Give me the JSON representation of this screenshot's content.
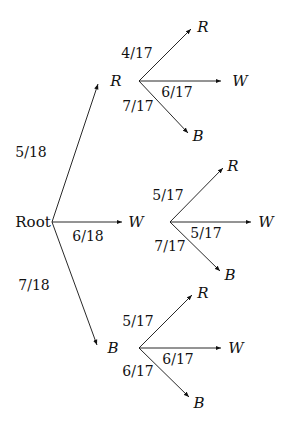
{
  "diagram": {
    "type": "probability-tree",
    "root": {
      "label": "Root",
      "x": 33,
      "y": 222
    },
    "first_level": [
      {
        "label": "R",
        "prob": "5/18",
        "node_x": 116,
        "node_y": 81,
        "tip_x": 98,
        "tip_y": 84,
        "prob_x": 31,
        "prob_y": 152
      },
      {
        "label": "W",
        "prob": "6/18",
        "node_x": 136,
        "node_y": 222,
        "tip_x": 122,
        "tip_y": 222,
        "prob_x": 88,
        "prob_y": 236
      },
      {
        "label": "B",
        "prob": "7/18",
        "node_x": 113,
        "node_y": 348,
        "tip_x": 97,
        "tip_y": 345,
        "prob_x": 34,
        "prob_y": 285
      }
    ],
    "second_level": [
      {
        "parent": "R",
        "origin_x": 139,
        "origin_y": 81,
        "branches": [
          {
            "label": "R",
            "prob": "4/17",
            "tip_x": 191,
            "tip_y": 29,
            "node_x": 203,
            "node_y": 27,
            "prob_x": 137,
            "prob_y": 53
          },
          {
            "label": "W",
            "prob": "6/17",
            "tip_x": 221,
            "tip_y": 81,
            "node_x": 240,
            "node_y": 81,
            "prob_x": 177,
            "prob_y": 92
          },
          {
            "label": "B",
            "prob": "7/17",
            "tip_x": 188,
            "tip_y": 133,
            "node_x": 198,
            "node_y": 136,
            "prob_x": 138,
            "prob_y": 106
          }
        ]
      },
      {
        "parent": "W",
        "origin_x": 170,
        "origin_y": 222,
        "branches": [
          {
            "label": "R",
            "prob": "5/17",
            "tip_x": 223,
            "tip_y": 168,
            "node_x": 233,
            "node_y": 166,
            "prob_x": 168,
            "prob_y": 195
          },
          {
            "label": "W",
            "prob": "5/17",
            "tip_x": 251,
            "tip_y": 222,
            "node_x": 266,
            "node_y": 222,
            "prob_x": 206,
            "prob_y": 233
          },
          {
            "label": "B",
            "prob": "7/17",
            "tip_x": 220,
            "tip_y": 271,
            "node_x": 230,
            "node_y": 275,
            "prob_x": 170,
            "prob_y": 246
          }
        ]
      },
      {
        "parent": "B",
        "origin_x": 139,
        "origin_y": 348,
        "branches": [
          {
            "label": "R",
            "prob": "5/17",
            "tip_x": 192,
            "tip_y": 295,
            "node_x": 203,
            "node_y": 293,
            "prob_x": 138,
            "prob_y": 321
          },
          {
            "label": "W",
            "prob": "6/17",
            "tip_x": 221,
            "tip_y": 348,
            "node_x": 236,
            "node_y": 348,
            "prob_x": 178,
            "prob_y": 359
          },
          {
            "label": "B",
            "prob": "6/17",
            "tip_x": 189,
            "tip_y": 397,
            "node_x": 199,
            "node_y": 403,
            "prob_x": 138,
            "prob_y": 371
          }
        ]
      }
    ]
  },
  "text": {
    "root": "Root",
    "l1_R": "R",
    "l1_W": "W",
    "l1_B": "B",
    "p_R": "5/18",
    "p_W": "6/18",
    "p_B": "7/18",
    "R_R": "R",
    "R_W": "W",
    "R_B": "B",
    "R_pR": "4/17",
    "R_pW": "6/17",
    "R_pB": "7/17",
    "W_R": "R",
    "W_W": "W",
    "W_B": "B",
    "W_pR": "5/17",
    "W_pW": "5/17",
    "W_pB": "7/17",
    "B_R": "R",
    "B_W": "W",
    "B_B": "B",
    "B_pR": "5/17",
    "B_pW": "6/17",
    "B_pB": "6/17"
  }
}
